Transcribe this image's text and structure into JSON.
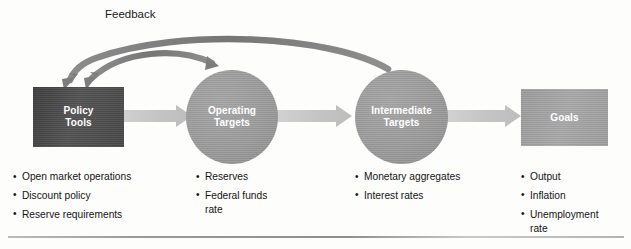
{
  "figure": {
    "background_color": "#fdfdfc",
    "feedback_label": "Feedback",
    "rule_color": "#9a9a9a"
  },
  "nodes": [
    {
      "id": "policy-tools",
      "label": "Policy\nTools",
      "shape": "rectangle",
      "fill": "#4a4a4a",
      "text_color": "#ffffff"
    },
    {
      "id": "operating-targets",
      "label": "Operating\nTargets",
      "shape": "ellipse",
      "fill": "#9a9a9a",
      "text_color": "#ffffff"
    },
    {
      "id": "intermediate-targets",
      "label": "Intermediate\nTargets",
      "shape": "ellipse",
      "fill": "#9a9a9a",
      "text_color": "#ffffff"
    },
    {
      "id": "goals",
      "label": "Goals",
      "shape": "rectangle",
      "fill": "#a3a3a3",
      "text_color": "#ffffff"
    }
  ],
  "connectors": [
    {
      "id": "policy-to-operating",
      "from": "policy-tools",
      "to": "operating-targets",
      "style": "block-arrow",
      "color": "#c6c6c6"
    },
    {
      "id": "operating-to-intermediate",
      "from": "operating-targets",
      "to": "intermediate-targets",
      "style": "block-arrow",
      "color": "#c6c6c6"
    },
    {
      "id": "intermediate-to-goals",
      "from": "intermediate-targets",
      "to": "goals",
      "style": "block-arrow",
      "color": "#c6c6c6"
    },
    {
      "id": "feedback-short",
      "from": "operating-targets",
      "to": "policy-tools",
      "style": "curved-arrow",
      "color": "#7a7a7a"
    },
    {
      "id": "feedback-long",
      "from": "intermediate-targets",
      "to": "policy-tools",
      "style": "curved-arrow",
      "color": "#7a7a7a"
    }
  ],
  "columns": [
    {
      "id": "policy-tools-items",
      "items": [
        "Open market operations",
        "Discount policy",
        "Reserve requirements"
      ]
    },
    {
      "id": "operating-targets-items",
      "items": [
        "Reserves",
        "Federal funds\nrate"
      ]
    },
    {
      "id": "intermediate-targets-items",
      "items": [
        "Monetary aggregates",
        "Interest rates"
      ]
    },
    {
      "id": "goals-items",
      "items": [
        "Output",
        "Inflation",
        "Unemployment\nrate"
      ]
    }
  ]
}
